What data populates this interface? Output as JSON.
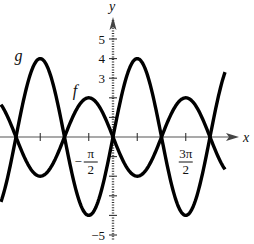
{
  "chart_data": {
    "type": "line",
    "title": "",
    "xlabel": "x",
    "ylabel": "y",
    "xlim_over_pi": [
      -2.31,
      2.31
    ],
    "ylim": [
      -5.2,
      6
    ],
    "grid": false,
    "legend": "none (curves labeled inline)",
    "x_ticks_over_pi": [
      -1.5,
      -1,
      -0.5,
      0.5,
      1,
      1.5
    ],
    "x_tick_labels": [
      {
        "value_over_pi": -0.5,
        "sign": "−",
        "numerator": "π",
        "denominator": "2"
      },
      {
        "value_over_pi": 1.5,
        "sign": "",
        "numerator": "3π",
        "denominator": "2"
      }
    ],
    "y_ticks": [
      -5,
      -4,
      -3,
      -2,
      -1,
      1,
      2,
      3,
      4,
      5
    ],
    "y_tick_labels": [
      {
        "value": 5,
        "text": "5"
      },
      {
        "value": 4,
        "text": "4"
      },
      {
        "value": 3,
        "text": "3"
      },
      {
        "value": -5,
        "text": "−5"
      }
    ],
    "series": [
      {
        "name": "g",
        "label": "g",
        "expression": "4 sin x",
        "amplitude": 4,
        "sign": 1,
        "key_points": [
          [
            -2,
            0
          ],
          [
            -1.5,
            4
          ],
          [
            -1,
            0
          ],
          [
            -0.5,
            -4
          ],
          [
            0,
            0
          ],
          [
            0.5,
            4
          ],
          [
            1,
            0
          ],
          [
            1.5,
            -4
          ],
          [
            2,
            0
          ]
        ],
        "key_points_note": "x in multiples of pi"
      },
      {
        "name": "f",
        "label": "f",
        "expression": "-2 sin x",
        "amplitude": 2,
        "sign": -1,
        "key_points": [
          [
            -2,
            0
          ],
          [
            -1.5,
            -2
          ],
          [
            -1,
            0
          ],
          [
            -0.5,
            2
          ],
          [
            0,
            0
          ],
          [
            0.5,
            -2
          ],
          [
            1,
            0
          ],
          [
            1.5,
            2
          ],
          [
            2,
            0
          ]
        ],
        "key_points_note": "x in multiples of pi"
      }
    ]
  }
}
